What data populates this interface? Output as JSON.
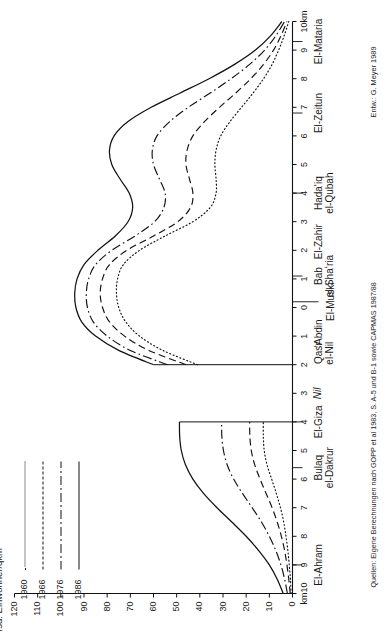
{
  "figure": {
    "y_axis_title": "Tsd. Einwohner/qkm",
    "credit": "Entw.: G. Meyer 1989",
    "source": "Quellen: Eigene Berechnungen nach GOPP et al 1983, S. A-5 und B-1 sowie CAPMAS 1987/88",
    "nile_label": "Nil",
    "x_unit_left": "km10",
    "x_unit_right": "10km"
  },
  "legend": {
    "items": [
      {
        "year": "1960",
        "style": "dotted"
      },
      {
        "year": "1966",
        "style": "dashed"
      },
      {
        "year": "1976",
        "style": "dash-dot"
      },
      {
        "year": "1986",
        "style": "solid"
      }
    ]
  },
  "chart_data": {
    "type": "line",
    "title": "",
    "xlabel": "",
    "ylabel": "Tsd. Einwohner/qkm",
    "ylim": [
      0,
      120
    ],
    "yticks": [
      0,
      10,
      20,
      30,
      40,
      50,
      60,
      70,
      80,
      90,
      100,
      110,
      120
    ],
    "ytick_labels": [
      "0",
      "10",
      "20",
      "30",
      "40",
      "50",
      "60",
      "70",
      "80",
      "90",
      "100",
      "110",
      "120"
    ],
    "xlim": [
      -10,
      10
    ],
    "xticks": [
      -10,
      -9,
      -8,
      -7,
      -6,
      -5,
      -4,
      -3,
      -2,
      -1,
      0,
      1,
      2,
      3,
      4,
      5,
      6,
      7,
      8,
      9,
      10
    ],
    "xtick_labels": [
      "km10",
      "9",
      "8",
      "7",
      "6",
      "5",
      "4",
      "3",
      "2",
      "1",
      "0",
      "1",
      "2",
      "3",
      "4",
      "5",
      "6",
      "7",
      "8",
      "9",
      "10km"
    ],
    "grid": false,
    "legend_position": "top-left",
    "nile_gap": [
      -4.0,
      -2.0
    ],
    "districts": [
      {
        "label": "El-Ahram",
        "x": -9.0
      },
      {
        "label": "Bulaq\nel-Dakrur",
        "x": -5.6
      },
      {
        "label": "El-Giza",
        "x": -4.0
      },
      {
        "label": "Nil",
        "x": -3.0
      },
      {
        "label": "Qasr\nel-Nil",
        "x": -1.6
      },
      {
        "label": "ʻAbdin",
        "x": -0.9
      },
      {
        "label": "El-Muski",
        "x": 0.2
      },
      {
        "label": "Bab\nel-Shaʻria",
        "x": 1.1
      },
      {
        "label": "El-Zahir",
        "x": 2.3
      },
      {
        "label": "Hadaʻiq\nel-Qubah",
        "x": 4.0
      },
      {
        "label": "El-Zeitun",
        "x": 6.8
      },
      {
        "label": "El-Mataria",
        "x": 9.3
      }
    ],
    "series": [
      {
        "name": "1960",
        "style": "dotted",
        "x": [
          -10.0,
          -9.5,
          -9.0,
          -8.5,
          -8.0,
          -7.5,
          -7.0,
          -6.5,
          -6.0,
          -5.5,
          -5.0,
          -4.5,
          -4.0,
          -2.0,
          -1.5,
          -1.0,
          -0.5,
          0.0,
          0.5,
          1.0,
          1.5,
          2.0,
          2.5,
          3.0,
          3.5,
          4.0,
          4.5,
          5.0,
          5.5,
          6.0,
          6.5,
          7.0,
          7.5,
          8.0,
          8.5,
          9.0,
          9.5,
          10.0
        ],
        "y": [
          0.6,
          0.9,
          1.4,
          2.0,
          2.8,
          3.8,
          5.2,
          7.0,
          9.0,
          11.0,
          12.2,
          12.6,
          12.6,
          41.0,
          56.0,
          66.0,
          72.0,
          75.0,
          76.0,
          75.5,
          73.0,
          66.0,
          55.0,
          43.0,
          35.5,
          33.0,
          33.0,
          33.5,
          33.0,
          31.0,
          27.0,
          22.0,
          17.0,
          12.5,
          8.8,
          6.0,
          3.6,
          1.6
        ]
      },
      {
        "name": "1966",
        "style": "dashed",
        "x": [
          -10.0,
          -9.5,
          -9.0,
          -8.5,
          -8.0,
          -7.5,
          -7.0,
          -6.5,
          -6.0,
          -5.5,
          -5.0,
          -4.5,
          -4.0,
          -2.0,
          -1.5,
          -1.0,
          -0.5,
          0.0,
          0.5,
          1.0,
          1.5,
          2.0,
          2.5,
          3.0,
          3.5,
          4.0,
          4.5,
          5.0,
          5.5,
          6.0,
          6.5,
          7.0,
          7.5,
          8.0,
          8.5,
          9.0,
          9.5,
          10.0
        ],
        "y": [
          1.0,
          1.6,
          2.4,
          3.4,
          4.8,
          6.6,
          8.8,
          11.4,
          14.0,
          16.3,
          17.8,
          18.4,
          18.5,
          46.0,
          62.0,
          72.5,
          79.0,
          82.0,
          83.0,
          82.0,
          79.0,
          71.5,
          60.0,
          49.5,
          44.0,
          43.0,
          44.5,
          46.0,
          45.5,
          43.0,
          38.0,
          31.5,
          24.5,
          18.0,
          12.5,
          8.2,
          5.0,
          2.4
        ]
      },
      {
        "name": "1976",
        "style": "dash-dot",
        "x": [
          -10.0,
          -9.5,
          -9.0,
          -8.5,
          -8.0,
          -7.5,
          -7.0,
          -6.5,
          -6.0,
          -5.5,
          -5.0,
          -4.5,
          -4.0,
          -2.0,
          -1.5,
          -1.0,
          -0.5,
          0.0,
          0.5,
          1.0,
          1.5,
          2.0,
          2.5,
          3.0,
          3.5,
          4.0,
          4.5,
          5.0,
          5.5,
          6.0,
          6.5,
          7.0,
          7.5,
          8.0,
          8.5,
          9.0,
          9.5,
          10.0
        ],
        "y": [
          2.2,
          3.4,
          5.0,
          7.2,
          10.0,
          13.4,
          17.4,
          21.6,
          25.4,
          28.2,
          29.8,
          30.5,
          30.6,
          54.0,
          70.0,
          80.0,
          86.0,
          88.5,
          89.0,
          88.0,
          85.0,
          78.0,
          68.0,
          59.5,
          55.5,
          55.0,
          57.5,
          60.0,
          60.5,
          58.5,
          53.0,
          45.0,
          35.5,
          26.5,
          18.5,
          12.0,
          7.2,
          3.4
        ]
      },
      {
        "name": "1986",
        "style": "solid",
        "x": [
          -10.0,
          -9.5,
          -9.0,
          -8.5,
          -8.0,
          -7.5,
          -7.0,
          -6.5,
          -6.0,
          -5.5,
          -5.0,
          -4.5,
          -4.0,
          -2.0,
          -1.5,
          -1.0,
          -0.5,
          0.0,
          0.5,
          1.0,
          1.5,
          2.0,
          2.5,
          3.0,
          3.5,
          4.0,
          4.5,
          5.0,
          5.5,
          6.0,
          6.5,
          7.0,
          7.5,
          8.0,
          8.5,
          9.0,
          9.5,
          10.0
        ],
        "y": [
          4.0,
          6.6,
          10.0,
          14.6,
          20.0,
          26.2,
          32.6,
          38.4,
          43.0,
          46.2,
          48.0,
          48.7,
          48.8,
          60.0,
          75.0,
          85.0,
          91.0,
          93.5,
          94.0,
          93.0,
          90.0,
          84.0,
          76.5,
          71.0,
          69.0,
          70.5,
          74.5,
          78.0,
          79.0,
          77.0,
          71.0,
          61.0,
          48.5,
          36.0,
          25.0,
          16.0,
          9.5,
          4.6
        ]
      }
    ]
  }
}
